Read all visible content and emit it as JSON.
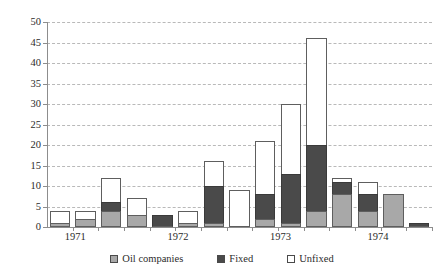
{
  "chart_data": {
    "type": "bar",
    "stacked": true,
    "title": "",
    "subtitle": "",
    "xlabel": "",
    "ylabel": "",
    "ylim": [
      0,
      50
    ],
    "ytick_step": 5,
    "ytick_labels": [
      "0",
      "5",
      "10",
      "15",
      "20",
      "25",
      "30",
      "35",
      "40",
      "45",
      "50"
    ],
    "grid": true,
    "grid_style": "dashed horizontal",
    "legend_position": "bottom-center",
    "categories": [
      "1",
      "2",
      "3",
      "4",
      "5",
      "6",
      "7",
      "8",
      "9",
      "10",
      "11",
      "12",
      "13",
      "14",
      "15"
    ],
    "x_axis_group_labels": [
      "1971",
      "1972",
      "1973",
      "1974"
    ],
    "series": [
      {
        "name": "Oil companies",
        "color": "#a8a8a8",
        "values": [
          1,
          2,
          4,
          3,
          0,
          1,
          1,
          0,
          2,
          1,
          4,
          8,
          4,
          8,
          0
        ]
      },
      {
        "name": "Fixed",
        "color": "#4a4a4a",
        "values": [
          0,
          0,
          2,
          0,
          3,
          0,
          9,
          0,
          6,
          12,
          16,
          3,
          4,
          0,
          1
        ]
      },
      {
        "name": "Unfixed",
        "color": "#ffffff",
        "values": [
          3,
          2,
          6,
          4,
          0,
          3,
          6,
          9,
          13,
          17,
          26,
          1,
          3,
          0,
          0
        ]
      }
    ],
    "totals": [
      4,
      4,
      12,
      7,
      3,
      4,
      16,
      9,
      21,
      30,
      46,
      12,
      11,
      8,
      1
    ]
  },
  "legend": {
    "items": [
      {
        "label": "Oil companies",
        "swatch": "oil"
      },
      {
        "label": "Fixed",
        "swatch": "fixed"
      },
      {
        "label": "Unfixed",
        "swatch": "unfixed"
      }
    ]
  },
  "colors": {
    "oil_companies": "#a8a8a8",
    "fixed": "#4a4a4a",
    "unfixed": "#ffffff",
    "gridline": "#b9b9b9",
    "axis": "#8d8d8d",
    "text": "#2b2b2b"
  }
}
